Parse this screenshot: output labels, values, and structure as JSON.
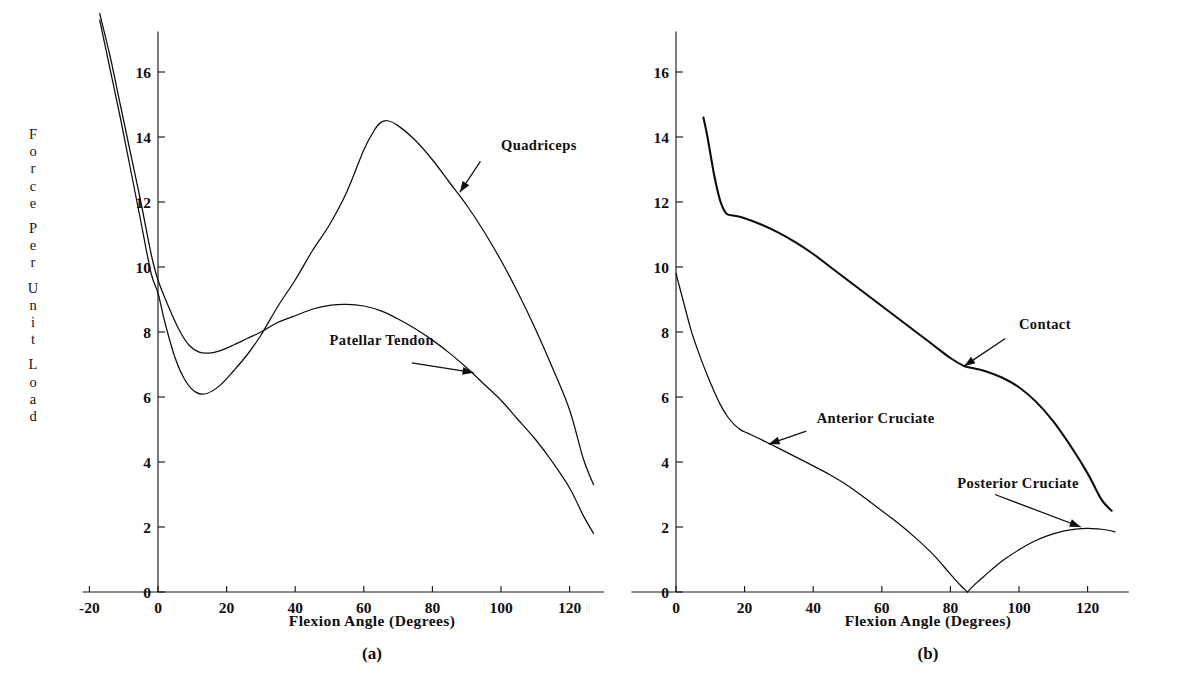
{
  "figure": {
    "y_axis_label_chars": [
      "F",
      "o",
      "r",
      "c",
      "e",
      "",
      "P",
      "e",
      "r",
      "",
      "U",
      "n",
      "i",
      "t",
      "",
      "L",
      "o",
      "a",
      "d"
    ],
    "y_axis_label_text": "Force Per Unit Load"
  },
  "panel_a": {
    "caption": "Flexion Angle (Degrees)",
    "letter": "(a)"
  },
  "panel_b": {
    "caption": "Flexion Angle (Degrees)",
    "letter": "(b)"
  },
  "annotations": {
    "quadriceps": "Quadriceps",
    "patellar_tendon": "Patellar Tendon",
    "contact": "Contact",
    "anterior_cruciate": "Anterior Cruciate",
    "posterior_cruciate": "Posterior Cruciate"
  },
  "chart_data": [
    {
      "type": "line",
      "id": "panel-a",
      "title": "(a)",
      "xlabel": "Flexion Angle (Degrees)",
      "ylabel": "Force Per Unit Load",
      "xlim": [
        -22,
        130
      ],
      "ylim": [
        0,
        17.2
      ],
      "xticks": [
        -20,
        0,
        20,
        40,
        60,
        80,
        100,
        120
      ],
      "xtick_labels": [
        "-20",
        "0",
        "20",
        "40",
        "60",
        "80",
        "100",
        "120"
      ],
      "yticks": [
        0,
        2,
        4,
        6,
        8,
        10,
        12,
        14,
        16
      ],
      "ytick_labels": [
        "0",
        "2",
        "4",
        "6",
        "8",
        "10",
        "12",
        "14",
        "16"
      ],
      "grid": false,
      "legend": "annotated-inline",
      "series": [
        {
          "name": "Quadriceps",
          "x": [
            -17,
            -14,
            -11,
            -8,
            -5,
            -2,
            0,
            2,
            5,
            8,
            11,
            14,
            18,
            22,
            26,
            30,
            35,
            40,
            45,
            50,
            55,
            60,
            63,
            65,
            67,
            70,
            75,
            80,
            85,
            90,
            95,
            100,
            105,
            110,
            115,
            120,
            124,
            127
          ],
          "y": [
            17.6,
            16.1,
            14.6,
            13.0,
            11.4,
            9.8,
            9.2,
            8.3,
            7.2,
            6.5,
            6.15,
            6.1,
            6.35,
            6.8,
            7.3,
            7.9,
            8.8,
            9.6,
            10.5,
            11.3,
            12.3,
            13.6,
            14.2,
            14.45,
            14.5,
            14.35,
            13.9,
            13.3,
            12.6,
            11.9,
            11.1,
            10.2,
            9.2,
            8.1,
            6.9,
            5.6,
            4.1,
            3.3
          ]
        },
        {
          "name": "Patellar Tendon",
          "x": [
            -17,
            -14,
            -11,
            -8,
            -5,
            -2,
            0,
            3,
            6,
            9,
            12,
            15,
            18,
            22,
            26,
            30,
            35,
            40,
            45,
            50,
            55,
            60,
            65,
            70,
            75,
            80,
            85,
            90,
            95,
            100,
            105,
            110,
            115,
            120,
            124,
            127
          ],
          "y": [
            17.8,
            16.5,
            15.0,
            13.5,
            12.0,
            10.4,
            9.6,
            8.8,
            8.1,
            7.6,
            7.38,
            7.35,
            7.42,
            7.6,
            7.8,
            8.0,
            8.3,
            8.5,
            8.7,
            8.82,
            8.85,
            8.8,
            8.65,
            8.4,
            8.1,
            7.75,
            7.35,
            6.9,
            6.4,
            5.9,
            5.3,
            4.7,
            4.0,
            3.2,
            2.35,
            1.8
          ]
        }
      ],
      "annotations": [
        {
          "label": "Quadriceps",
          "points_to_x": 88,
          "points_to_y": 12.3
        },
        {
          "label": "Patellar Tendon",
          "points_to_x": 92,
          "points_to_y": 6.75
        }
      ]
    },
    {
      "type": "line",
      "id": "panel-b",
      "title": "(b)",
      "xlabel": "Flexion Angle (Degrees)",
      "ylabel": "Force Per Unit Load",
      "xlim": [
        -4,
        132
      ],
      "ylim": [
        0,
        17.2
      ],
      "xticks": [
        0,
        20,
        40,
        60,
        80,
        100,
        120
      ],
      "xtick_labels": [
        "0",
        "20",
        "40",
        "60",
        "80",
        "100",
        "120"
      ],
      "yticks": [
        0,
        2,
        4,
        6,
        8,
        10,
        12,
        14,
        16
      ],
      "ytick_labels": [
        "0",
        "2",
        "4",
        "6",
        "8",
        "10",
        "12",
        "14",
        "16"
      ],
      "grid": false,
      "legend": "annotated-inline",
      "series": [
        {
          "name": "Contact",
          "x": [
            8,
            9,
            10,
            11,
            12,
            13,
            14,
            15,
            17,
            20,
            25,
            30,
            35,
            40,
            45,
            50,
            55,
            60,
            65,
            70,
            75,
            80,
            84,
            86,
            90,
            95,
            100,
            105,
            110,
            115,
            120,
            124,
            127
          ],
          "y": [
            14.6,
            14.1,
            13.5,
            12.9,
            12.4,
            12.0,
            11.75,
            11.62,
            11.58,
            11.5,
            11.3,
            11.05,
            10.75,
            10.4,
            10.0,
            9.6,
            9.2,
            8.8,
            8.4,
            8.0,
            7.6,
            7.2,
            6.95,
            6.9,
            6.8,
            6.6,
            6.3,
            5.85,
            5.25,
            4.5,
            3.65,
            2.85,
            2.5
          ]
        },
        {
          "name": "Anterior Cruciate",
          "x": [
            0,
            1,
            2,
            3,
            4,
            5,
            7,
            9,
            11,
            13,
            15,
            17,
            19,
            21,
            25,
            30,
            35,
            40,
            45,
            50,
            55,
            60,
            65,
            70,
            75,
            80,
            83,
            85
          ],
          "y": [
            9.8,
            9.4,
            9.0,
            8.6,
            8.2,
            7.85,
            7.25,
            6.7,
            6.2,
            5.75,
            5.4,
            5.15,
            4.98,
            4.88,
            4.68,
            4.42,
            4.15,
            3.88,
            3.6,
            3.28,
            2.9,
            2.5,
            2.1,
            1.65,
            1.15,
            0.55,
            0.2,
            0.0
          ]
        },
        {
          "name": "Posterior Cruciate",
          "x": [
            85,
            87,
            90,
            93,
            96,
            100,
            104,
            108,
            112,
            116,
            120,
            123,
            126,
            128
          ],
          "y": [
            0.0,
            0.22,
            0.5,
            0.78,
            1.02,
            1.3,
            1.54,
            1.72,
            1.85,
            1.93,
            1.96,
            1.94,
            1.9,
            1.85
          ]
        }
      ],
      "annotations": [
        {
          "label": "Contact",
          "points_to_x": 84,
          "points_to_y": 6.95
        },
        {
          "label": "Anterior Cruciate",
          "points_to_x": 27,
          "points_to_y": 4.55
        },
        {
          "label": "Posterior Cruciate",
          "points_to_x": 118,
          "points_to_y": 2.0
        }
      ]
    }
  ]
}
